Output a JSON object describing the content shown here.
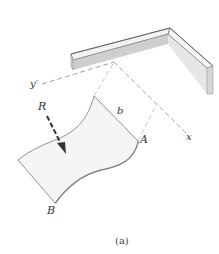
{
  "figure": {
    "caption": "(a)",
    "labels": {
      "y_prime_axis": "y′",
      "x_axis": "x",
      "resultant_force": "R",
      "width_dimension": "b",
      "point_a": "A",
      "point_b": "B"
    },
    "colors": {
      "outline": "#555555",
      "dashed_line": "#888888",
      "wall_face": "#d4d4d4",
      "wall_top": "#f2f2f2",
      "plate_fill": "#f4f4f4",
      "plate_edge_shadow": "#9a9a9a",
      "arrow": "#333333"
    }
  }
}
